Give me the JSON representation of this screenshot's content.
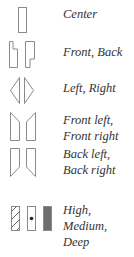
{
  "legend": {
    "items": [
      {
        "id": "center",
        "icon": "center-speaker-icon",
        "lines": [
          "Center"
        ]
      },
      {
        "id": "front-back",
        "icon": "front-back-speaker-icon",
        "lines": [
          "Front, Back"
        ]
      },
      {
        "id": "left-right",
        "icon": "left-right-speaker-icon",
        "lines": [
          "Left, Right"
        ]
      },
      {
        "id": "front-left-right",
        "icon": "front-left-right-speaker-icon",
        "lines": [
          "Front left,",
          "Front right"
        ]
      },
      {
        "id": "back-left-right",
        "icon": "back-left-right-speaker-icon",
        "lines": [
          "Back left,",
          "Back right"
        ]
      },
      {
        "id": "depth",
        "icon": "high-medium-deep-icon",
        "lines": [
          "High,",
          "Medium,",
          "Deep"
        ]
      }
    ],
    "colors": {
      "stroke": "#8a8a8a",
      "text": "#333333",
      "deep_fill": "#6e6e6e"
    }
  }
}
